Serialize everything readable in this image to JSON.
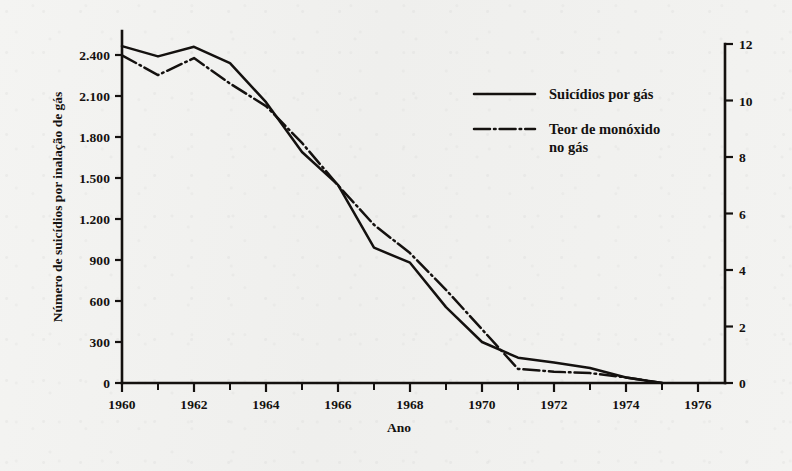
{
  "chart_data": {
    "type": "line",
    "title": "",
    "xlabel": "Ano",
    "ylabel": "Número de suicídios por inalação de gás",
    "ylabel_right": "",
    "x": [
      1960,
      1961,
      1962,
      1963,
      1964,
      1965,
      1966,
      1967,
      1968,
      1969,
      1970,
      1971,
      1972,
      1973,
      1974,
      1975
    ],
    "xlim": [
      1959,
      1977
    ],
    "xticks": [
      1960,
      1962,
      1964,
      1966,
      1968,
      1970,
      1972,
      1974,
      1976
    ],
    "xticklabels": [
      "1960",
      "1962",
      "1964",
      "1966",
      "1968",
      "1970",
      "1972",
      "1974",
      "1976"
    ],
    "xminor_ticks": [
      1961,
      1963,
      1965,
      1967,
      1969,
      1971,
      1973,
      1975,
      1977
    ],
    "ylim": [
      0,
      2700
    ],
    "yticks": [
      0,
      300,
      600,
      900,
      1200,
      1500,
      1800,
      2100,
      2400
    ],
    "yticklabels": [
      "0",
      "300",
      "600",
      "900",
      "1.200",
      "1.500",
      "1.800",
      "2.100",
      "2.400"
    ],
    "ylim_right": [
      0,
      12
    ],
    "yticks_right": [
      0,
      2,
      4,
      6,
      8,
      10,
      12
    ],
    "yticklabels_right": [
      "0",
      "2",
      "4",
      "6",
      "8",
      "10",
      "12"
    ],
    "grid": false,
    "legend_position": "center-right",
    "series": [
      {
        "name": "Suicídios por gás",
        "axis": "left",
        "style": "solid",
        "values": [
          2465,
          2390,
          2460,
          2340,
          2055,
          1690,
          1450,
          990,
          880,
          555,
          300,
          185,
          150,
          110,
          40,
          0
        ]
      },
      {
        "name": "Teor de monóxido no gás",
        "axis": "right",
        "style": "dash-dot",
        "values": [
          11.6,
          10.9,
          11.5,
          10.6,
          9.8,
          8.5,
          7.0,
          5.6,
          4.6,
          3.3,
          1.9,
          0.5,
          0.4,
          0.35,
          0.2,
          0.0
        ]
      }
    ]
  },
  "legend": {
    "items": [
      {
        "label": "Suicídios por gás",
        "style": "solid"
      },
      {
        "label": "Teor de monóxido",
        "label2": "no gás",
        "style": "dash-dot"
      }
    ]
  },
  "colors": {
    "ink": "#14110f",
    "paper": "#f2f2f0"
  }
}
